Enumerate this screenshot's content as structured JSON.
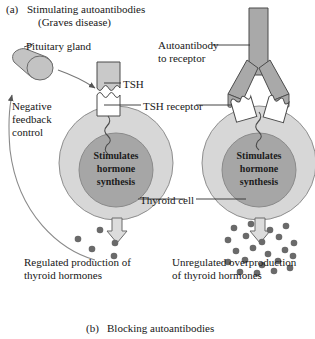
{
  "figure": {
    "panel_a": {
      "marker": "(a)",
      "line1": "Stimulating autoantibodies",
      "line2": "(Graves disease)"
    },
    "panel_b": {
      "marker": "(b)",
      "line1": "Blocking autoantibodies"
    }
  },
  "labels": {
    "pituitary_gland": "Pituitary gland",
    "tsh": "TSH",
    "tsh_receptor": "TSH receptor",
    "autoantibody_line1": "Autoantibody",
    "autoantibody_line2": "to receptor",
    "negative_line1": "Negative",
    "negative_line2": "feedback",
    "negative_line3": "control",
    "thyroid_cell": "Thyroid cell"
  },
  "nucleus_text": {
    "line1": "Stimulates",
    "line2": "hormone",
    "line3": "synthesis"
  },
  "captions": {
    "left_line1": "Regulated production of",
    "left_line2": "thyroid hormones",
    "right_line1": "Unregulated overproduction",
    "right_line2": "of thyroid hormones"
  },
  "hormone_dots": {
    "left_count": 5,
    "right_count": 22,
    "left_positions": [
      [
        78,
        239
      ],
      [
        100,
        230
      ],
      [
        115,
        243
      ],
      [
        92,
        249
      ],
      [
        114,
        256
      ]
    ],
    "right_positions": [
      [
        234,
        228
      ],
      [
        251,
        224
      ],
      [
        270,
        230
      ],
      [
        286,
        226
      ],
      [
        228,
        240
      ],
      [
        246,
        236
      ],
      [
        262,
        242
      ],
      [
        279,
        237
      ],
      [
        294,
        243
      ],
      [
        236,
        251
      ],
      [
        253,
        248
      ],
      [
        268,
        254
      ],
      [
        285,
        250
      ],
      [
        228,
        262
      ],
      [
        245,
        260
      ],
      [
        262,
        265
      ],
      [
        278,
        261
      ],
      [
        293,
        256
      ],
      [
        240,
        272
      ],
      [
        257,
        273
      ],
      [
        274,
        271
      ],
      [
        290,
        268
      ]
    ]
  },
  "colors": {
    "cell_membrane": "#d7d7d7",
    "nucleus": "#a6a6a6",
    "antibody_fill": "#a9a9a9",
    "tsh_fill": "#c9c9c9",
    "pituitary_fill": "#c3c3c3",
    "receptor_fill": "#ffffff",
    "dot_fill": "#6a6a6a",
    "outline": "#3a3a3a",
    "text": "#171717",
    "background": "#ffffff"
  },
  "icons": {
    "secretion_arrow": "down-block-arrow",
    "feedback_arrow": "curved-feedback-arrow",
    "pointer_arrow": "pituitary-to-tsh-arrow"
  }
}
